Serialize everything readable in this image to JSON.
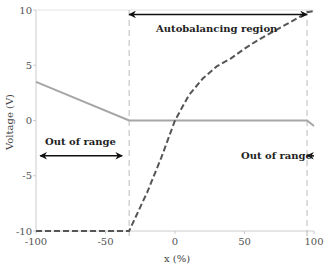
{
  "chart_data": {
    "type": "line",
    "title": "",
    "xlabel": "x (%)",
    "ylabel": "Voltage (V)",
    "xlim": [
      -100,
      100
    ],
    "ylim": [
      -10,
      10
    ],
    "xticks": [
      -100,
      -50,
      0,
      50,
      100
    ],
    "yticks": [
      -10,
      -5,
      0,
      5,
      10
    ],
    "xtick_labels": [
      "-100",
      "-50",
      "0",
      "50",
      "100"
    ],
    "ytick_labels": [
      "-10",
      "-5",
      "0",
      "5",
      "10"
    ],
    "grid": false,
    "colors": {
      "solid_series": "#a6a6a6",
      "dashed_series": "#555555",
      "axis": "#cccccc",
      "boundary": "#bbbbbb",
      "arrow": "#111111"
    },
    "series": [
      {
        "name": "Solid gray line",
        "style": "solid",
        "x": [
          -100,
          -33,
          95,
          100
        ],
        "y": [
          3.5,
          0,
          0,
          -0.5
        ]
      },
      {
        "name": "Dashed dark curve",
        "style": "dashed",
        "x": [
          -100,
          -33,
          -20,
          -10,
          0,
          10,
          20,
          30,
          40,
          50,
          60,
          70,
          80,
          90,
          95,
          100
        ],
        "y": [
          -10,
          -10,
          -6.5,
          -3.4,
          0,
          2.3,
          3.8,
          4.9,
          5.6,
          6.5,
          7.3,
          8.0,
          8.7,
          9.4,
          9.8,
          9.9
        ]
      }
    ],
    "vertical_lines": [
      {
        "name": "lower boundary",
        "x": -33,
        "style": "dashed"
      },
      {
        "name": "upper boundary",
        "x": 95,
        "style": "dashed"
      }
    ],
    "annotations": [
      {
        "text": "Autobalancing region",
        "arrow_from_x": -33,
        "arrow_to_x": 95,
        "arrow_y": 9.6,
        "text_x": 30,
        "text_y": 8.3,
        "double_headed": true
      },
      {
        "text": "Out of range",
        "arrow_from_x": -97,
        "arrow_to_x": -38,
        "arrow_y": -3.2,
        "text_x": -68,
        "text_y": -1.9,
        "double_headed": true
      },
      {
        "text": "Out of range",
        "arrow_from_x": 100,
        "arrow_to_x": 95,
        "arrow_y": -3.2,
        "text_x": 73,
        "text_y": -3.2,
        "double_headed": false
      }
    ]
  }
}
